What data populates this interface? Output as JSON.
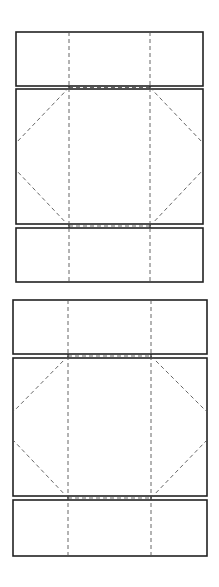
{
  "diagram": {
    "title": "",
    "colors": {
      "background": "#ffffff",
      "cut_line": "#222222",
      "fold_line": "#555555"
    },
    "legend": {
      "solid": "cut line",
      "dashed": "fold line"
    },
    "templates": [
      {
        "id": "template-1",
        "outer": {
          "left": 16,
          "right": 203,
          "top": 32,
          "bottom": 282
        },
        "fold_x": [
          69,
          150
        ],
        "panels": [
          {
            "name": "top-flap",
            "top": 32,
            "bottom": 86
          },
          {
            "name": "main-panel",
            "top": 89,
            "bottom": 224
          },
          {
            "name": "bottom-flap",
            "top": 228,
            "bottom": 282
          }
        ],
        "fold_y": [
          87.5,
          226
        ],
        "diagonal_edge_y": [
          143,
          170
        ]
      },
      {
        "id": "template-2",
        "outer": {
          "left": 13,
          "right": 207,
          "top": 300,
          "bottom": 556
        },
        "fold_x": [
          68,
          151
        ],
        "panels": [
          {
            "name": "top-flap",
            "top": 300,
            "bottom": 354
          },
          {
            "name": "main-panel",
            "top": 358,
            "bottom": 496
          },
          {
            "name": "bottom-flap",
            "top": 500,
            "bottom": 556
          }
        ],
        "fold_y": [
          356,
          498
        ],
        "diagonal_edge_y": [
          412,
          440
        ]
      }
    ]
  }
}
